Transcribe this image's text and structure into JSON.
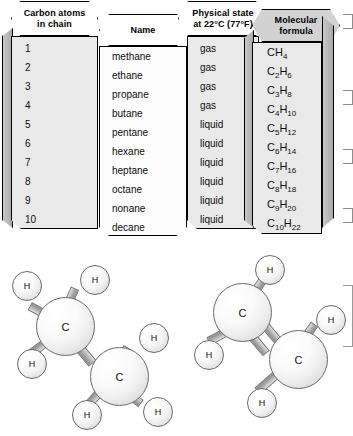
{
  "figure": {
    "table": {
      "columns": [
        {
          "header_line1": "Carbon atoms",
          "header_line2": "in chain"
        },
        {
          "header_line1": "Name",
          "header_line2": ""
        },
        {
          "header_line1": "Physical state",
          "header_line2": "at 22°C (77°F)"
        },
        {
          "header_line1": "Molecular",
          "header_line2": "formula"
        }
      ],
      "rows": [
        {
          "carbons": "1",
          "name": "methane",
          "state": "gas",
          "formula_c_sub": "",
          "formula_h_sub": "4"
        },
        {
          "carbons": "2",
          "name": "ethane",
          "state": "gas",
          "formula_c_sub": "2",
          "formula_h_sub": "6"
        },
        {
          "carbons": "3",
          "name": "propane",
          "state": "gas",
          "formula_c_sub": "3",
          "formula_h_sub": "8"
        },
        {
          "carbons": "4",
          "name": "butane",
          "state": "gas",
          "formula_c_sub": "4",
          "formula_h_sub": "10"
        },
        {
          "carbons": "5",
          "name": "pentane",
          "state": "liquid",
          "formula_c_sub": "5",
          "formula_h_sub": "12"
        },
        {
          "carbons": "6",
          "name": "hexane",
          "state": "liquid",
          "formula_c_sub": "6",
          "formula_h_sub": "14"
        },
        {
          "carbons": "7",
          "name": "heptane",
          "state": "liquid",
          "formula_c_sub": "7",
          "formula_h_sub": "16"
        },
        {
          "carbons": "8",
          "name": "octane",
          "state": "liquid",
          "formula_c_sub": "8",
          "formula_h_sub": "18"
        },
        {
          "carbons": "9",
          "name": "nonane",
          "state": "liquid",
          "formula_c_sub": "9",
          "formula_h_sub": "20"
        },
        {
          "carbons": "10",
          "name": "decane",
          "state": "liquid",
          "formula_c_sub": "10",
          "formula_h_sub": "22"
        }
      ]
    },
    "molecules": [
      {
        "id": "ethane-model",
        "bond_type": "single",
        "carbon_label": "C",
        "hydrogen_label": "H",
        "carbon_count": 2,
        "hydrogen_count": 6
      },
      {
        "id": "ethene-model",
        "bond_type": "double",
        "carbon_label": "C",
        "hydrogen_label": "H",
        "carbon_count": 2,
        "hydrogen_count": 4
      }
    ]
  }
}
